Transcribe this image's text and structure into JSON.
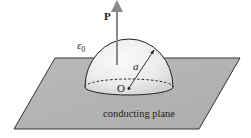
{
  "figure": {
    "type": "physics-diagram",
    "labels": {
      "polarization": "P",
      "permittivity": "ε",
      "permittivity_subscript": "0",
      "radius": "a",
      "origin": "O",
      "plane": "conducting plane"
    },
    "colors": {
      "plane_fill": "#b4b4b4",
      "plane_stroke": "#333333",
      "hemisphere_light": "#f4f4f4",
      "hemisphere_shade": "#cfcfcf",
      "arrow_color": "#8a8a8a",
      "line_color": "#222222"
    },
    "geometry": {
      "plane_corners": [
        [
          55,
          58
        ],
        [
          240,
          58
        ],
        [
          199,
          129
        ],
        [
          14,
          129
        ]
      ],
      "hemisphere_center": [
        129,
        87
      ],
      "hemisphere_radius_x": 44,
      "hemisphere_radius_y_dome": 48,
      "base_ellipse_ry": 8,
      "polarization_arrow": {
        "x": 117,
        "y_start": 65,
        "y_end": 3
      },
      "radius_arrow": {
        "from": [
          129,
          88
        ],
        "to": [
          154,
          50
        ]
      }
    }
  }
}
